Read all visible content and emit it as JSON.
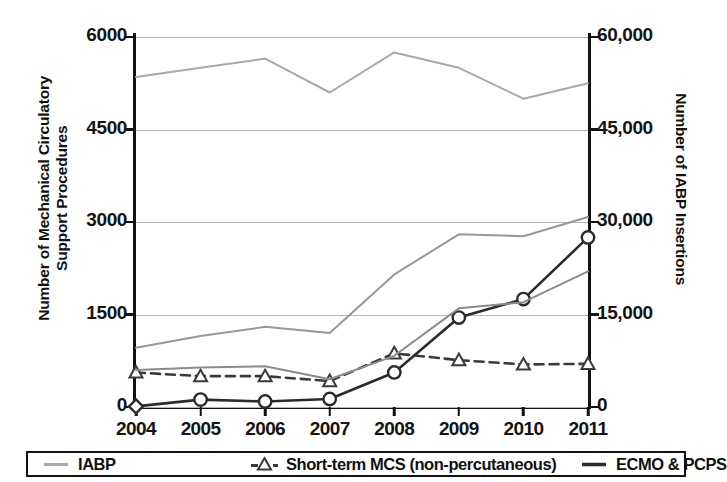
{
  "chart_data": {
    "type": "line",
    "title": "",
    "x": [
      "2004",
      "2005",
      "2006",
      "2007",
      "2008",
      "2009",
      "2010",
      "2011"
    ],
    "categories": [
      "2004",
      "2005",
      "2006",
      "2007",
      "2008",
      "2009",
      "2010",
      "2011"
    ],
    "xlabel": "",
    "ylabel": "Number of Mechanical Circulatory\nSupport Procedures",
    "ylabel_secondary": "Number of IABP Insertions",
    "ylim": [
      0,
      6000
    ],
    "ylim_secondary": [
      0,
      60000
    ],
    "yticks": [
      0,
      1500,
      3000,
      4500,
      6000
    ],
    "ytick_labels": [
      "0",
      "1500",
      "3000",
      "4500",
      "6000"
    ],
    "yticks_secondary": [
      0,
      15000,
      30000,
      45000,
      60000
    ],
    "ytick_labels_secondary": [
      "0",
      "15,000",
      "30,000",
      "45,000",
      "60,000"
    ],
    "grid": true,
    "grid_axis": "y",
    "legend_position": "bottom",
    "series": [
      {
        "name": "IABP",
        "axis": "secondary",
        "color": "#a9a9a9",
        "marker": "none",
        "dash": "solid",
        "values": [
          53500,
          55000,
          56500,
          51000,
          57500,
          55000,
          50000,
          52500
        ]
      },
      {
        "name": "Total MCS",
        "axis": "primary",
        "color": "#989898",
        "marker": "none",
        "dash": "solid",
        "in_legend": false,
        "values": [
          960,
          1150,
          1300,
          1200,
          2150,
          2800,
          2770,
          3080
        ]
      },
      {
        "name": "Short-term MCS (non-percutaneous)",
        "axis": "primary",
        "color": "#3a3a3a",
        "marker": "triangle",
        "dash": "dashed",
        "values": [
          560,
          500,
          500,
          420,
          870,
          760,
          690,
          700
        ]
      },
      {
        "name": "ECMO & PCPS",
        "axis": "primary",
        "color": "#2b2b2b",
        "marker": "circle",
        "dash": "solid",
        "values": [
          10,
          120,
          90,
          130,
          560,
          1450,
          1750,
          2750
        ]
      },
      {
        "name": "VAD",
        "axis": "primary",
        "color": "#8c8c8c",
        "marker": "none",
        "dash": "solid",
        "in_legend": false,
        "values": [
          600,
          640,
          660,
          450,
          830,
          1600,
          1700,
          2200
        ]
      }
    ]
  },
  "legend": {
    "entries": [
      {
        "label": "IABP",
        "marker": "line-gray"
      },
      {
        "label": "Short-term MCS (non-percutaneous)",
        "marker": "dashed-triangle"
      },
      {
        "label": "ECMO & PCPS",
        "marker": "line-dark"
      }
    ]
  },
  "colors": {
    "iabp": "#a9a9a9",
    "total_mcs": "#989898",
    "short_term_mcs": "#3a3a3a",
    "ecmo_pcps": "#2b2b2b",
    "vad": "#8c8c8c",
    "axis": "#111111",
    "grid": "#b4b4b4"
  }
}
